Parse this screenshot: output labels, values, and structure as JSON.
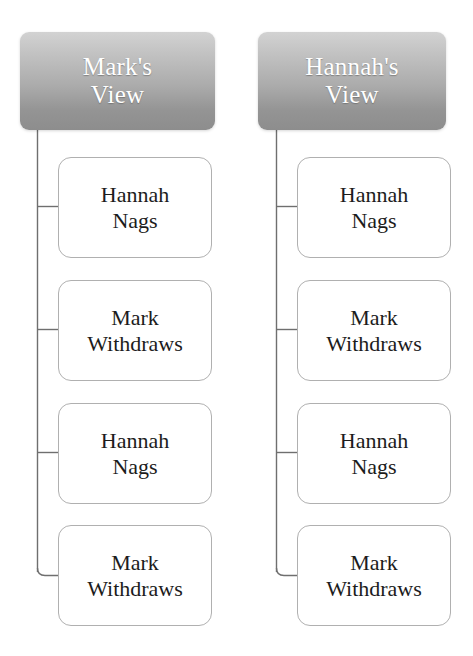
{
  "diagram": {
    "type": "tree",
    "title": "",
    "columns": [
      {
        "id": "marks-view",
        "header": {
          "label": "Mark's View",
          "line1": "Mark's",
          "line2": "View"
        },
        "nodes": [
          {
            "label": "Hannah Nags",
            "line1": "Hannah",
            "line2": "Nags"
          },
          {
            "label": "Mark Withdraws",
            "line1": "Mark",
            "line2": "Withdraws"
          },
          {
            "label": "Hannah Nags",
            "line1": "Hannah",
            "line2": "Nags"
          },
          {
            "label": "Mark Withdraws",
            "line1": "Mark",
            "line2": "Withdraws"
          }
        ]
      },
      {
        "id": "hannahs-view",
        "header": {
          "label": "Hannah's View",
          "line1": "Hannah's",
          "line2": "View"
        },
        "nodes": [
          {
            "label": "Hannah Nags",
            "line1": "Hannah",
            "line2": "Nags"
          },
          {
            "label": "Mark Withdraws",
            "line1": "Mark",
            "line2": "Withdraws"
          },
          {
            "label": "Hannah Nags",
            "line1": "Hannah",
            "line2": "Nags"
          },
          {
            "label": "Mark Withdraws",
            "line1": "Mark",
            "line2": "Withdraws"
          }
        ]
      }
    ],
    "colors": {
      "header_gradient_top": "#d2d2d2",
      "header_gradient_bottom": "#8d8d8d",
      "header_text": "#ffffff",
      "node_background": "#ffffff",
      "node_border": "#b0b0b0",
      "node_text": "#1c1c1c",
      "connector_line": "#6f6f6f",
      "page_background": "#ffffff"
    }
  }
}
